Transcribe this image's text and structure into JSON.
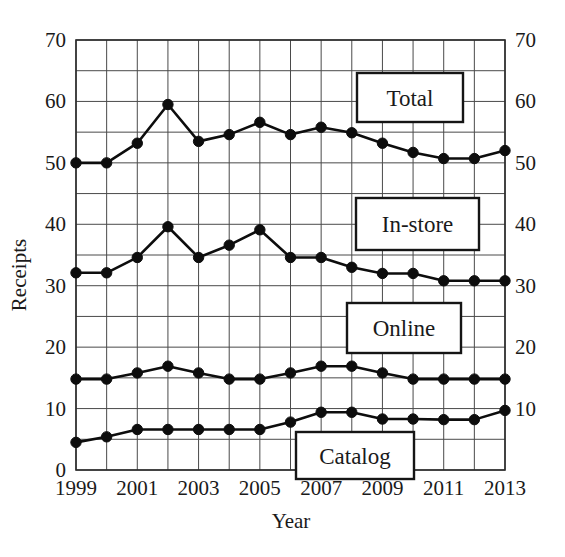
{
  "chart_data": {
    "type": "line",
    "title": "",
    "xlabel": "Year",
    "ylabel": "Receipts",
    "xlim": [
      1999,
      2013
    ],
    "ylim": [
      0,
      70
    ],
    "y_ticks": [
      0,
      10,
      20,
      30,
      40,
      50,
      60,
      70
    ],
    "y_minor_step": 5,
    "x_ticks": [
      1999,
      2001,
      2003,
      2005,
      2007,
      2009,
      2011,
      2013
    ],
    "x_minor_step": 1,
    "grid": true,
    "legend_position": "inside-right",
    "x": [
      1999,
      2000,
      2001,
      2002,
      2003,
      2004,
      2005,
      2006,
      2007,
      2008,
      2009,
      2010,
      2011,
      2012,
      2013
    ],
    "series": [
      {
        "name": "Total",
        "values": [
          50.0,
          50.0,
          53.2,
          59.5,
          53.5,
          54.6,
          56.6,
          54.6,
          55.8,
          54.9,
          53.2,
          51.7,
          50.7,
          50.7,
          52.0
        ]
      },
      {
        "name": "In-store",
        "values": [
          32.1,
          32.1,
          34.6,
          39.6,
          34.6,
          36.6,
          39.1,
          34.6,
          34.6,
          33.0,
          32.0,
          32.0,
          30.8,
          30.8,
          30.8
        ]
      },
      {
        "name": "Online",
        "values": [
          14.8,
          14.8,
          15.8,
          16.9,
          15.8,
          14.8,
          14.8,
          15.8,
          16.9,
          16.9,
          15.8,
          14.8,
          14.8,
          14.8,
          14.8
        ]
      },
      {
        "name": "Catalog",
        "values": [
          4.5,
          5.4,
          6.6,
          6.6,
          6.6,
          6.6,
          6.6,
          7.8,
          9.4,
          9.4,
          8.3,
          8.3,
          8.2,
          8.2,
          9.7
        ]
      }
    ]
  },
  "axes": {
    "y_left_labels": [
      "70",
      "60",
      "50",
      "40",
      "30",
      "20",
      "10",
      "0"
    ],
    "y_right_labels": [
      "70",
      "60",
      "50",
      "40",
      "30",
      "20",
      "10"
    ],
    "x_labels": [
      "1999",
      "2001",
      "2003",
      "2005",
      "2007",
      "2009",
      "2011",
      "2013"
    ],
    "x_axis_title": "Year",
    "y_axis_title": "Receipts"
  },
  "legend": {
    "items": [
      {
        "label": "Total",
        "x": 357,
        "y": 73,
        "w": 106,
        "h": 49
      },
      {
        "label": "In-store",
        "x": 356,
        "y": 198,
        "w": 123,
        "h": 52
      },
      {
        "label": "Online",
        "x": 347,
        "y": 303,
        "w": 114,
        "h": 50
      },
      {
        "label": "Catalog",
        "x": 296,
        "y": 432,
        "w": 118,
        "h": 47
      }
    ]
  },
  "colors": {
    "series_stroke": "#0d0d0d",
    "grid": "#4a4a4a",
    "frame": "#2b2b2b",
    "background": "#ffffff",
    "text": "#1a1a1a"
  }
}
